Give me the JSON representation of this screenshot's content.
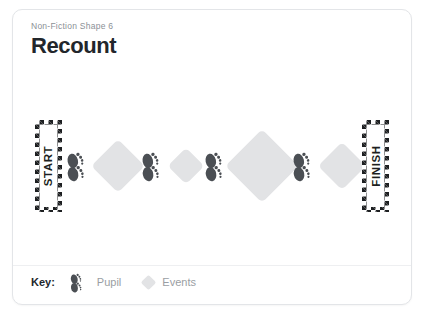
{
  "card": {
    "subtitle": "Non-Fiction Shape 6",
    "title": "Recount"
  },
  "track": {
    "start_label": "START",
    "finish_label": "FINISH",
    "sequence": [
      {
        "type": "flag",
        "label": "START"
      },
      {
        "type": "footprints",
        "name": "pupil"
      },
      {
        "type": "diamond",
        "name": "event",
        "size": "medium"
      },
      {
        "type": "footprints",
        "name": "pupil"
      },
      {
        "type": "diamond",
        "name": "event",
        "size": "small"
      },
      {
        "type": "footprints",
        "name": "pupil"
      },
      {
        "type": "diamond",
        "name": "event",
        "size": "large"
      },
      {
        "type": "footprints",
        "name": "pupil"
      },
      {
        "type": "diamond",
        "name": "event",
        "size": "medium"
      },
      {
        "type": "flag",
        "label": "FINISH"
      }
    ]
  },
  "key": {
    "label": "Key:",
    "items": [
      {
        "icon": "footprints-icon",
        "text": "Pupil"
      },
      {
        "icon": "diamond-icon",
        "text": "Events"
      }
    ]
  },
  "colors": {
    "flag_dark": "#1d1f21",
    "diamond_fill": "#e2e3e5",
    "footprint_fill": "#4b4f54",
    "title_text": "#22262b",
    "subtitle_text": "#8b9096",
    "key_text": "#9a9ea3",
    "card_border": "#e3e5e8",
    "background": "#ffffff"
  }
}
